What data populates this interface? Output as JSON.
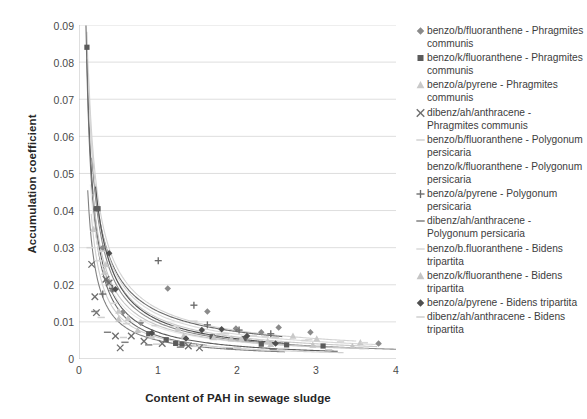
{
  "chart": {
    "type": "scatter",
    "title": "",
    "xlabel": "Content of PAH in sewage sludge",
    "ylabel": "Accumulation coefficient",
    "xlim": [
      0,
      4
    ],
    "ylim": [
      0,
      0.09
    ],
    "xticks": [
      "0",
      "1",
      "2",
      "3",
      "4"
    ],
    "yticks": [
      "0",
      "0.01",
      "0.02",
      "0.03",
      "0.04",
      "0.05",
      "0.06",
      "0.07",
      "0.08",
      "0.09"
    ],
    "grid": "horizontal",
    "legend_position": "right"
  },
  "legend": {
    "items": [
      {
        "label": "benzo/b/fluoranthene - Phragmites communis",
        "marker": "diamond-marker",
        "color": "#8a8a8a"
      },
      {
        "label": "benzo/k/fluoranthene - Phragmites communis",
        "marker": "square-marker",
        "color": "#5b5b5b"
      },
      {
        "label": "benzo/a/pyrene - Phragmites communis",
        "marker": "triangle-marker",
        "color": "#c9c9c9"
      },
      {
        "label": "dibenz/ah/anthracene - Phragmites communis",
        "marker": "cross-x-marker",
        "color": "#6e6e6e"
      },
      {
        "label": "benzo/b/fluoranthene - Polygonum persicaria",
        "marker": "dash-marker",
        "color": "#d2d2d2"
      },
      {
        "label": "benzo/k/fluoranthene - Polygonum persicaria",
        "marker": "blank-marker",
        "color": "#e8e8e8"
      },
      {
        "label": "benzo/a/pyrene - Polygonum persicaria",
        "marker": "plus-marker",
        "color": "#6a6a6a"
      },
      {
        "label": "dibenz/ah/anthracene - Polygonum persicaria",
        "marker": "dash-marker",
        "color": "#808080"
      },
      {
        "label": "benzo/b.fluoranthene - Bidens tripartita",
        "marker": "dash-marker",
        "color": "#d8d8d8"
      },
      {
        "label": "benzo/k/fluoranthene - Bidens tripartita",
        "marker": "triangle-marker",
        "color": "#c5c5c5"
      },
      {
        "label": "benzo/a/pyrene - Bidens tripartita",
        "marker": "diamond-filled-marker",
        "color": "#4f4f4f"
      },
      {
        "label": "dibenz/ah/anthracene - Bidens tripartita",
        "marker": "dash-marker",
        "color": "#cfcfcf"
      }
    ]
  },
  "chart_data": {
    "type": "scatter",
    "title": "",
    "xlabel": "Content of PAH in sewage sludge",
    "ylabel": "Accumulation coefficient",
    "xlim": [
      0,
      4
    ],
    "ylim": [
      0,
      0.09
    ],
    "xticks": [
      0,
      1,
      2,
      3,
      4
    ],
    "yticks": [
      0,
      0.01,
      0.02,
      0.03,
      0.04,
      0.05,
      0.06,
      0.07,
      0.08,
      0.09
    ],
    "grid": "horizontal",
    "legend_position": "right",
    "series": [
      {
        "name": "benzo/b/fluoranthene - Phragmites communis",
        "marker": "diamond",
        "color": "#8a8a8a",
        "trendline": {
          "type": "power",
          "a": 0.0098,
          "b": -0.95
        },
        "points": [
          [
            0.3,
            0.03
          ],
          [
            0.36,
            0.021
          ],
          [
            0.42,
            0.0185
          ],
          [
            0.55,
            0.0125
          ],
          [
            0.78,
            0.0098
          ],
          [
            1.12,
            0.019
          ],
          [
            1.62,
            0.0128
          ],
          [
            1.98,
            0.0082
          ],
          [
            2.3,
            0.0072
          ],
          [
            2.52,
            0.0085
          ],
          [
            2.92,
            0.0072
          ],
          [
            3.78,
            0.0042
          ]
        ]
      },
      {
        "name": "benzo/k/fluoranthene - Phragmites communis",
        "marker": "square",
        "color": "#5b5b5b",
        "trendline": {
          "type": "power",
          "a": 0.0072,
          "b": -1.05
        },
        "points": [
          [
            0.1,
            0.084
          ],
          [
            0.22,
            0.0405
          ],
          [
            0.24,
            0.0405
          ],
          [
            0.88,
            0.0068
          ],
          [
            1.1,
            0.0052
          ],
          [
            1.22,
            0.0042
          ],
          [
            1.3,
            0.004
          ],
          [
            1.68,
            0.006
          ],
          [
            2.08,
            0.0055
          ],
          [
            2.3,
            0.004
          ],
          [
            2.62,
            0.0038
          ],
          [
            3.08,
            0.0035
          ]
        ]
      },
      {
        "name": "benzo/a/pyrene - Phragmites communis",
        "marker": "triangle",
        "color": "#c9c9c9",
        "trendline": {
          "type": "power",
          "a": 0.011,
          "b": -0.9
        },
        "points": [
          [
            0.18,
            0.035
          ],
          [
            0.34,
            0.0255
          ],
          [
            0.5,
            0.013
          ],
          [
            0.62,
            0.011
          ],
          [
            0.92,
            0.0062
          ],
          [
            1.25,
            0.0082
          ],
          [
            1.7,
            0.0058
          ],
          [
            2.05,
            0.0055
          ],
          [
            2.38,
            0.0048
          ],
          [
            2.7,
            0.0062
          ],
          [
            3.0,
            0.0055
          ],
          [
            3.55,
            0.0045
          ]
        ]
      },
      {
        "name": "dibenz/ah/anthracene - Phragmites communis",
        "marker": "x",
        "color": "#6e6e6e",
        "trendline": {
          "type": "power",
          "a": 0.0062,
          "b": -1.1
        },
        "points": [
          [
            0.16,
            0.0255
          ],
          [
            0.2,
            0.0168
          ],
          [
            0.22,
            0.0125
          ],
          [
            0.34,
            0.0215
          ],
          [
            0.38,
            0.0205
          ],
          [
            0.46,
            0.0062
          ],
          [
            0.52,
            0.003
          ],
          [
            0.66,
            0.0062
          ],
          [
            0.82,
            0.0048
          ],
          [
            1.05,
            0.0042
          ],
          [
            1.38,
            0.0035
          ],
          [
            1.52,
            0.003
          ]
        ]
      },
      {
        "name": "benzo/b/fluoranthene - Polygonum persicaria",
        "marker": "dash",
        "color": "#d2d2d2",
        "trendline": {
          "type": "power",
          "a": 0.0135,
          "b": -0.82
        },
        "points": [
          [
            0.14,
            0.03
          ],
          [
            0.28,
            0.029
          ],
          [
            0.6,
            0.0095
          ],
          [
            0.96,
            0.009
          ],
          [
            1.45,
            0.0102
          ],
          [
            1.85,
            0.0068
          ],
          [
            2.2,
            0.0062
          ],
          [
            2.48,
            0.0058
          ],
          [
            2.85,
            0.005
          ],
          [
            3.3,
            0.0046
          ]
        ]
      },
      {
        "name": "benzo/k/fluoranthene - Polygonum persicaria",
        "marker": "none",
        "color": "#e8e8e8",
        "trendline": {
          "type": "power",
          "a": 0.0085,
          "b": -0.88
        },
        "points": [
          [
            0.26,
            0.0185
          ],
          [
            0.48,
            0.0115
          ],
          [
            0.72,
            0.0092
          ],
          [
            1.18,
            0.007
          ],
          [
            1.72,
            0.0058
          ],
          [
            2.26,
            0.005
          ],
          [
            2.8,
            0.0045
          ],
          [
            3.4,
            0.004
          ]
        ]
      },
      {
        "name": "benzo/a/pyrene - Polygonum persicaria",
        "marker": "plus",
        "color": "#6a6a6a",
        "trendline": {
          "type": "power",
          "a": 0.0128,
          "b": -0.8
        },
        "points": [
          [
            0.3,
            0.0175
          ],
          [
            0.42,
            0.019
          ],
          [
            1.0,
            0.0265
          ],
          [
            1.45,
            0.0145
          ],
          [
            1.62,
            0.0092
          ],
          [
            2.02,
            0.0078
          ],
          [
            2.42,
            0.0068
          ]
        ]
      },
      {
        "name": "dibenz/ah/anthracene - Polygonum persicaria",
        "marker": "dash",
        "color": "#808080",
        "trendline": {
          "type": "power",
          "a": 0.005,
          "b": -1.0
        },
        "points": [
          [
            0.2,
            0.0128
          ],
          [
            0.36,
            0.0072
          ],
          [
            0.58,
            0.0045
          ],
          [
            0.88,
            0.0038
          ],
          [
            1.28,
            0.0032
          ],
          [
            1.9,
            0.0028
          ],
          [
            2.45,
            0.0026
          ]
        ]
      },
      {
        "name": "benzo/b.fluoranthene - Bidens tripartita",
        "marker": "dash",
        "color": "#d8d8d8",
        "trendline": {
          "type": "power",
          "a": 0.012,
          "b": -0.85
        },
        "points": [
          [
            0.24,
            0.0265
          ],
          [
            0.44,
            0.015
          ],
          [
            0.8,
            0.0102
          ],
          [
            1.2,
            0.0088
          ],
          [
            1.78,
            0.0068
          ],
          [
            2.35,
            0.006
          ],
          [
            2.9,
            0.0052
          ],
          [
            3.6,
            0.0044
          ]
        ]
      },
      {
        "name": "benzo/k/fluoranthene - Bidens tripartita",
        "marker": "triangle",
        "color": "#c5c5c5",
        "trendline": {
          "type": "power",
          "a": 0.009,
          "b": -0.92
        },
        "points": [
          [
            0.32,
            0.0235
          ],
          [
            0.5,
            0.0108
          ],
          [
            0.74,
            0.0078
          ],
          [
            1.32,
            0.0062
          ],
          [
            1.92,
            0.0055
          ],
          [
            2.42,
            0.004
          ],
          [
            2.95,
            0.0038
          ],
          [
            3.45,
            0.0035
          ]
        ]
      },
      {
        "name": "benzo/a/pyrene - Bidens tripartita",
        "marker": "diamond-filled",
        "color": "#4f4f4f",
        "trendline": {
          "type": "power",
          "a": 0.0105,
          "b": -0.95
        },
        "points": [
          [
            0.38,
            0.0285
          ],
          [
            0.46,
            0.0188
          ],
          [
            0.92,
            0.007
          ],
          [
            1.35,
            0.0055
          ],
          [
            1.55,
            0.0078
          ],
          [
            1.8,
            0.008
          ],
          [
            2.12,
            0.0062
          ],
          [
            2.48,
            0.0042
          ]
        ]
      },
      {
        "name": "dibenz/ah/anthracene - Bidens tripartita",
        "marker": "dash",
        "color": "#cfcfcf",
        "trendline": {
          "type": "power",
          "a": 0.0058,
          "b": -1.02
        },
        "points": [
          [
            0.28,
            0.0112
          ],
          [
            0.56,
            0.0058
          ],
          [
            0.98,
            0.004
          ],
          [
            1.48,
            0.0034
          ],
          [
            2.0,
            0.003
          ],
          [
            2.55,
            0.0028
          ],
          [
            3.15,
            0.0025
          ]
        ]
      }
    ]
  }
}
